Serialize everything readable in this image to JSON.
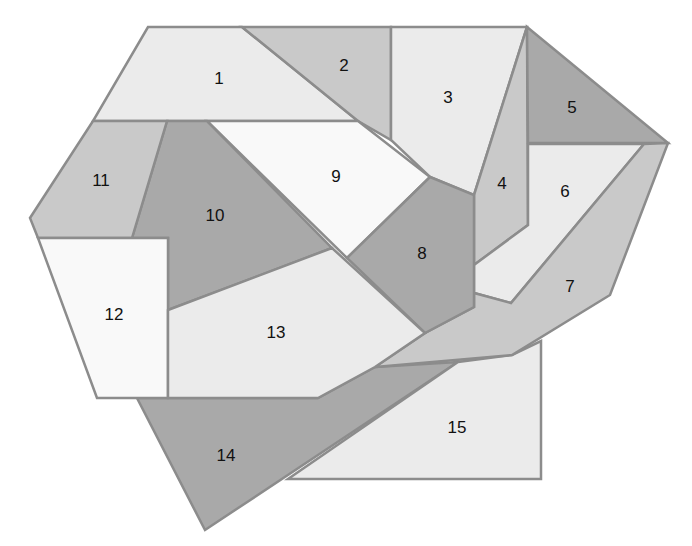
{
  "diagram": {
    "colors": {
      "white": "#f9f9f9",
      "light": "#ebebeb",
      "mid": "#c9c9c9",
      "dark": "#a9a9a9",
      "border": "#8c8c8c"
    },
    "pieces": [
      {
        "id": "14",
        "label": "14",
        "tone": "dark",
        "points": "137,398 318,398 375,367 458,362 205,530",
        "lx": 226,
        "ly": 457
      },
      {
        "id": "15",
        "label": "15",
        "tone": "light",
        "points": "288,479 541,479 541,341 512,355 458,362",
        "lx": 457,
        "ly": 429
      },
      {
        "id": "1",
        "label": "1",
        "tone": "light",
        "points": "148,27 242,27 358,121 93,121",
        "lx": 219,
        "ly": 80
      },
      {
        "id": "2",
        "label": "2",
        "tone": "mid",
        "points": "242,27 391,27 391,140 358,121",
        "lx": 344,
        "ly": 67
      },
      {
        "id": "3",
        "label": "3",
        "tone": "light",
        "points": "391,27 527,27 474,195 430,177 391,140",
        "lx": 448,
        "ly": 99
      },
      {
        "id": "4",
        "label": "4",
        "tone": "mid",
        "points": "527,27 528,225 474,265 474,195",
        "lx": 502,
        "ly": 185
      },
      {
        "id": "5",
        "label": "5",
        "tone": "dark",
        "points": "527,27 668,143 528,143",
        "lx": 572,
        "ly": 109
      },
      {
        "id": "6",
        "label": "6",
        "tone": "light",
        "points": "528,144 644,144 511,303 474,293 474,265 528,225",
        "lx": 565,
        "ly": 193
      },
      {
        "id": "7",
        "label": "7",
        "tone": "mid",
        "points": "644,144 668,143 610,295 512,355 375,367 425,333 474,307 474,293 511,303",
        "lx": 570,
        "ly": 288
      },
      {
        "id": "9",
        "label": "9",
        "tone": "white",
        "points": "207,121 358,121 430,177 347,258",
        "lx": 336,
        "ly": 178
      },
      {
        "id": "8",
        "label": "8",
        "tone": "dark",
        "points": "430,177 474,195 474,307 425,333 347,258",
        "lx": 422,
        "ly": 255
      },
      {
        "id": "10",
        "label": "10",
        "tone": "dark",
        "points": "167,121 207,121 332,248 168,310 168,238 132,238",
        "lx": 215,
        "ly": 217
      },
      {
        "id": "11",
        "label": "11",
        "tone": "mid",
        "points": "93,121 167,121 132,238 38,238 30,218",
        "lx": 101,
        "ly": 182
      },
      {
        "id": "12",
        "label": "12",
        "tone": "white",
        "points": "38,238 168,238 168,398 97,398",
        "lx": 114,
        "ly": 316
      },
      {
        "id": "13",
        "label": "13",
        "tone": "light",
        "points": "168,310 332,248 425,333 375,367 318,398 168,398",
        "lx": 276,
        "ly": 334
      }
    ]
  }
}
